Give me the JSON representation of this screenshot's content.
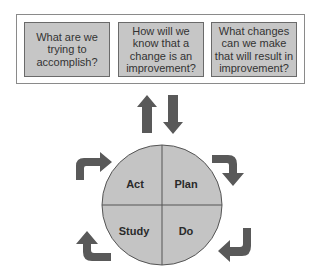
{
  "questions": [
    {
      "text": "What are we trying to accomplish?"
    },
    {
      "text": "How will we know that a change is an improvement?"
    },
    {
      "text": "What changes can we make that will result in improvement?"
    }
  ],
  "cycle": {
    "quadrants": {
      "top_left": "Act",
      "top_right": "Plan",
      "bottom_left": "Study",
      "bottom_right": "Do"
    }
  },
  "colors": {
    "box_fill": "#c6c6c6",
    "circle_fill": "#c4c4c4",
    "arrow_fill": "#595959",
    "line": "#555555"
  }
}
